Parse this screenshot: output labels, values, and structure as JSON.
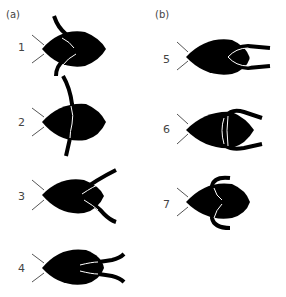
{
  "panels": [
    {
      "label": "(a)",
      "figures": [
        {
          "number": "1",
          "description": "larva with mandibles vertical, upper one curved over body"
        },
        {
          "number": "2",
          "description": "larva with single long vertical mandible crossing body"
        },
        {
          "number": "3",
          "description": "larva with mandibles extended diagonally backwards"
        },
        {
          "number": "4",
          "description": "larva with mandibles extended backwards, slightly spread"
        }
      ]
    },
    {
      "label": "(b)",
      "figures": [
        {
          "number": "5",
          "description": "larva with hooked mandibles extended backwards, closed loop"
        },
        {
          "number": "6",
          "description": "larva with mandibles opened, curving outward"
        },
        {
          "number": "7",
          "description": "larva with mandibles curled as C-shapes over body"
        }
      ]
    }
  ],
  "colors": {
    "body": "#000000",
    "line": "#ffffff",
    "antenna": "#555555",
    "text": "#444444"
  }
}
